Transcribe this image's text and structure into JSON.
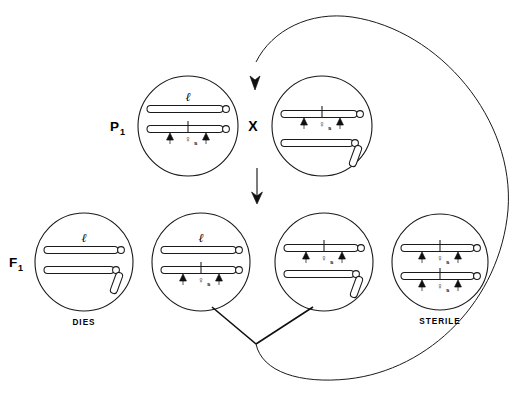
{
  "figure": {
    "type": "genetic-cross-diagram",
    "background": "#ffffff",
    "ink": "#1a1a1a",
    "generations": [
      {
        "id": "p1",
        "label": "P",
        "subscript": "1"
      },
      {
        "id": "f1",
        "label": "F",
        "subscript": "1"
      }
    ],
    "cross_symbol": "X",
    "gene_symbols": {
      "l": "ℓ",
      "q": "♀",
      "q_subscript": "s"
    },
    "fates": {
      "dies": "DIES",
      "sterile": "STERILE"
    },
    "cells": [
      {
        "id": "p1-left",
        "generation": "P1",
        "cx": 188,
        "cy": 126,
        "r": 50,
        "fate": "",
        "chromosomes": [
          {
            "y": 109,
            "x1": 147,
            "x2": 228,
            "label": "l",
            "label_x": 188,
            "label_y": 102,
            "marker": false,
            "arrows": [],
            "fragment": false
          },
          {
            "y": 129,
            "x1": 147,
            "x2": 228,
            "label": "",
            "marker": true,
            "marker_x": 188,
            "arrows": [
              170,
              206
            ],
            "fragment": false
          }
        ]
      },
      {
        "id": "p1-right",
        "generation": "P1",
        "cx": 322,
        "cy": 126,
        "r": 50,
        "fate": "",
        "chromosomes": [
          {
            "y": 114,
            "x1": 281,
            "x2": 362,
            "label": "",
            "marker": true,
            "marker_x": 322,
            "arrows": [
              304,
              340
            ],
            "fragment": false
          },
          {
            "y": 143,
            "x1": 281,
            "x2": 355,
            "label": "",
            "marker": false,
            "arrows": [],
            "fragment": true
          }
        ]
      },
      {
        "id": "f1-1",
        "generation": "F1",
        "cx": 84,
        "cy": 262,
        "r": 49,
        "fate": "DIES",
        "chromosomes": [
          {
            "y": 250,
            "x1": 44,
            "x2": 122,
            "label": "l",
            "label_x": 84,
            "label_y": 243,
            "marker": false,
            "arrows": [],
            "fragment": false
          },
          {
            "y": 270,
            "x1": 44,
            "x2": 116,
            "label": "",
            "marker": false,
            "arrows": [],
            "fragment": true
          }
        ]
      },
      {
        "id": "f1-2",
        "generation": "F1",
        "cx": 201,
        "cy": 262,
        "r": 49,
        "fate": "",
        "chromosomes": [
          {
            "y": 250,
            "x1": 161,
            "x2": 240,
            "label": "l",
            "label_x": 201,
            "label_y": 243,
            "marker": false,
            "arrows": [],
            "fragment": false
          },
          {
            "y": 270,
            "x1": 161,
            "x2": 240,
            "label": "",
            "marker": true,
            "marker_x": 201,
            "arrows": [
              183,
              219
            ],
            "fragment": false
          }
        ]
      },
      {
        "id": "f1-3",
        "generation": "F1",
        "cx": 324,
        "cy": 262,
        "r": 49,
        "fate": "",
        "chromosomes": [
          {
            "y": 248,
            "x1": 284,
            "x2": 362,
            "label": "",
            "marker": true,
            "marker_x": 324,
            "arrows": [
              306,
              342
            ],
            "fragment": false
          },
          {
            "y": 274,
            "x1": 284,
            "x2": 356,
            "label": "",
            "marker": false,
            "arrows": [],
            "fragment": true
          }
        ]
      },
      {
        "id": "f1-4",
        "generation": "F1",
        "cx": 440,
        "cy": 262,
        "r": 48,
        "fate": "STERILE",
        "chromosomes": [
          {
            "y": 248,
            "x1": 401,
            "x2": 478,
            "label": "",
            "marker": true,
            "marker_x": 440,
            "arrows": [
              422,
              458
            ],
            "fragment": false
          },
          {
            "y": 276,
            "x1": 401,
            "x2": 478,
            "label": "",
            "marker": true,
            "marker_x": 440,
            "arrows": [
              422,
              458
            ],
            "fragment": false
          }
        ]
      }
    ],
    "annotations": {
      "p1_label_x": 116,
      "p1_label_y": 130,
      "f1_label_x": 14,
      "f1_label_y": 266,
      "cross_x": 253,
      "cross_y": 131,
      "dies_x": 84,
      "dies_y": 322,
      "sterile_x": 440,
      "sterile_y": 321
    },
    "connectors": {
      "vertical_arrow": {
        "x": 257,
        "y1": 168,
        "y2": 202
      },
      "backcross_loop_arrow_tip": {
        "x": 255,
        "y": 88
      },
      "merge_point": {
        "x": 256,
        "y": 344
      }
    }
  }
}
